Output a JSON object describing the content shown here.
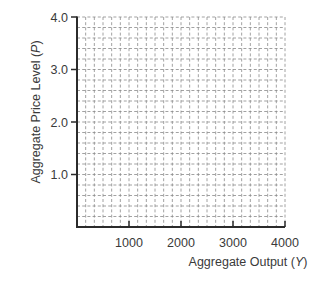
{
  "chart_data": {
    "type": "line",
    "title": "",
    "xlabel": "Aggregate Output (Y)",
    "ylabel": "Aggregate Price Level (P)",
    "xlabel_parts": {
      "text": "Aggregate Output (",
      "var": "Y",
      "close": ")"
    },
    "ylabel_parts": {
      "text": "Aggregate Price Level (",
      "var": "P",
      "close": ")"
    },
    "xlim": [
      0,
      4000
    ],
    "ylim": [
      0,
      4.0
    ],
    "x_ticks": [
      1000,
      2000,
      3000,
      4000
    ],
    "x_tick_labels": [
      "1000",
      "2000",
      "3000",
      "4000"
    ],
    "y_ticks": [
      1.0,
      2.0,
      3.0,
      4.0
    ],
    "y_tick_labels": [
      "1.0",
      "2.0",
      "3.0",
      "4.0"
    ],
    "grid": true,
    "grid_style": "dashed",
    "grid_columns": 24,
    "grid_rows": 20,
    "series": [],
    "legend": null
  },
  "colors": {
    "axis": "#2b2b2b",
    "grid": "#8a8a8a",
    "text": "#3a3a3a"
  }
}
